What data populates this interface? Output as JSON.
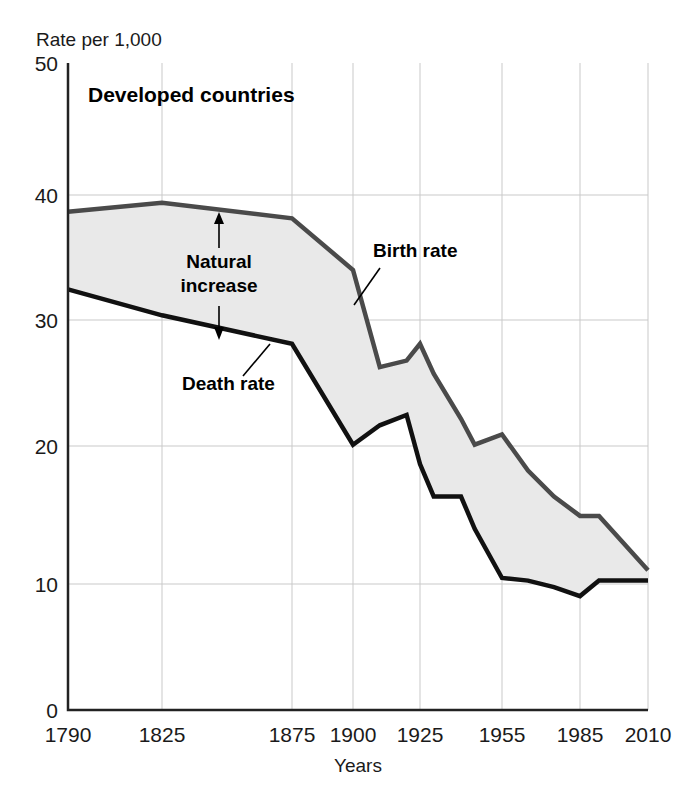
{
  "chart_data": {
    "type": "line",
    "title": "Developed countries",
    "xlabel": "Years",
    "ylabel": "Rate per 1,000",
    "xlim": [
      1790,
      2010
    ],
    "ylim": [
      0,
      50
    ],
    "grid": true,
    "legend_position": "inline-annotations",
    "x_ticks": [
      1790,
      1825,
      1875,
      1900,
      1925,
      1955,
      1985,
      2010
    ],
    "x_tick_labels": [
      "1790",
      "1825",
      "1875",
      "1900",
      "1925",
      "1955",
      "1985",
      "2010"
    ],
    "y_ticks": [
      0,
      10,
      20,
      30,
      40,
      50
    ],
    "y_tick_labels": [
      "0",
      "10",
      "20",
      "30",
      "40",
      "50"
    ],
    "x": [
      1790,
      1825,
      1875,
      1900,
      1910,
      1920,
      1925,
      1930,
      1940,
      1945,
      1955,
      1965,
      1975,
      1985,
      1992,
      2010
    ],
    "series": [
      {
        "name": "Birth rate",
        "color": "#4a4a4a",
        "values": [
          38.5,
          39.2,
          38.0,
          34.0,
          26.5,
          27.0,
          28.3,
          26.0,
          22.5,
          20.5,
          21.3,
          18.5,
          16.5,
          15.0,
          15.0,
          10.8
        ]
      },
      {
        "name": "Death rate",
        "color": "#111111",
        "values": [
          32.5,
          30.5,
          28.3,
          20.5,
          22.0,
          22.8,
          19.0,
          16.5,
          16.5,
          14.0,
          10.2,
          10.0,
          9.5,
          8.8,
          10.0,
          10.0
        ]
      }
    ],
    "fill_between": {
      "label": "Natural increase",
      "color": "#e9e9e9",
      "between": [
        "Birth rate",
        "Death rate"
      ]
    },
    "annotations": [
      {
        "name": "natural-increase",
        "text_line1": "Natural",
        "text_line2": "increase",
        "x": 1845,
        "arrow_up_to": 38.6,
        "arrow_down_to": 28.6
      },
      {
        "name": "birth-rate-label",
        "text": "Birth rate",
        "x": 1908,
        "y": 33.5
      },
      {
        "name": "death-rate-label",
        "text": "Death rate",
        "x": 1862,
        "y": 25.0
      }
    ]
  },
  "figure": {
    "y_axis_caption": "Rate per 1,000",
    "x_axis_caption": "Years",
    "panel_title": "Developed countries",
    "birth_label": "Birth rate",
    "death_label": "Death rate",
    "natural_line1": "Natural",
    "natural_line2": "increase",
    "tick_y_50": "50",
    "tick_y_40": "40",
    "tick_y_30": "30",
    "tick_y_20": "20",
    "tick_y_10": "10",
    "tick_y_0": "0",
    "tick_x_1790": "1790",
    "tick_x_1825": "1825",
    "tick_x_1875": "1875",
    "tick_x_1900": "1900",
    "tick_x_1925": "1925",
    "tick_x_1955": "1955",
    "tick_x_1985": "1985",
    "tick_x_2010": "2010"
  }
}
